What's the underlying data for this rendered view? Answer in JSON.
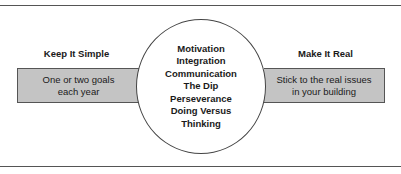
{
  "left": {
    "heading": "Keep It Simple",
    "box_lines": [
      "One or two goals",
      "each year"
    ]
  },
  "right": {
    "heading": "Make It Real",
    "box_lines": [
      "Stick to the real issues",
      "in your building"
    ]
  },
  "center": {
    "items": [
      "Motivation",
      "Integration",
      "Communication",
      "The Dip",
      "Perseverance",
      "Doing Versus",
      "Thinking"
    ]
  },
  "colors": {
    "box_fill": "#c4c4c4",
    "lines": "#555555"
  }
}
